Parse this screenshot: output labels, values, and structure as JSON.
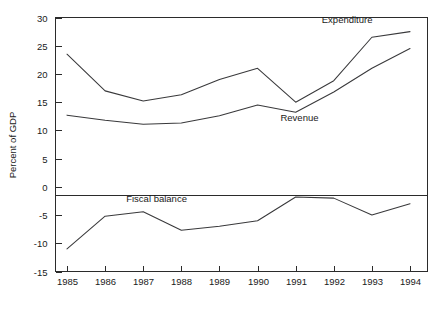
{
  "chart_data": {
    "type": "line",
    "title": "",
    "xlabel": "",
    "ylabel": "Percent of GDP",
    "categories": [
      "1985",
      "1986",
      "1987",
      "1988",
      "1989",
      "1990",
      "1991",
      "1992",
      "1993",
      "1994"
    ],
    "x": [
      1985,
      1986,
      1987,
      1988,
      1989,
      1990,
      1991,
      1992,
      1993,
      1994
    ],
    "ylim": [
      -15,
      30
    ],
    "yticks": [
      30,
      25,
      20,
      15,
      10,
      5,
      0,
      -5,
      -10,
      -15
    ],
    "ytick_labels": [
      "30",
      "25",
      "20",
      "15",
      "10",
      "5",
      "0",
      "-5",
      "-10",
      "-15"
    ],
    "xtick_labels": [
      "1985",
      "1986",
      "1987",
      "1988",
      "1989",
      "1990",
      "1991",
      "1992",
      "1993",
      "1994"
    ],
    "grid": false,
    "legend": "inline-annotations",
    "zero_reference_line": 0,
    "series": [
      {
        "name": "Expenditure",
        "values": [
          23.5,
          17.0,
          15.2,
          16.3,
          19.0,
          21.0,
          15.0,
          18.8,
          26.5,
          27.5
        ],
        "annotation": "Expenditure",
        "annotation_x": 1992.35,
        "annotation_y": 29.0
      },
      {
        "name": "Revenue",
        "values": [
          12.7,
          11.8,
          11.1,
          11.3,
          12.6,
          14.5,
          13.2,
          16.8,
          21.0,
          24.5
        ],
        "annotation": "Revenue",
        "annotation_x": 1991.1,
        "annotation_y": 11.6
      },
      {
        "name": "Fiscal balance",
        "values": [
          -11.0,
          -5.2,
          -4.4,
          -7.7,
          -7.0,
          -6.0,
          -1.8,
          -2.0,
          -5.0,
          -3.0
        ],
        "annotation": "Fiscal balance",
        "annotation_x": 1987.35,
        "annotation_y": -2.6
      }
    ],
    "colors": {
      "line": "#39393b",
      "axis": "#2b2b2b",
      "text": "#1a1a1a",
      "background": "#ffffff"
    }
  }
}
